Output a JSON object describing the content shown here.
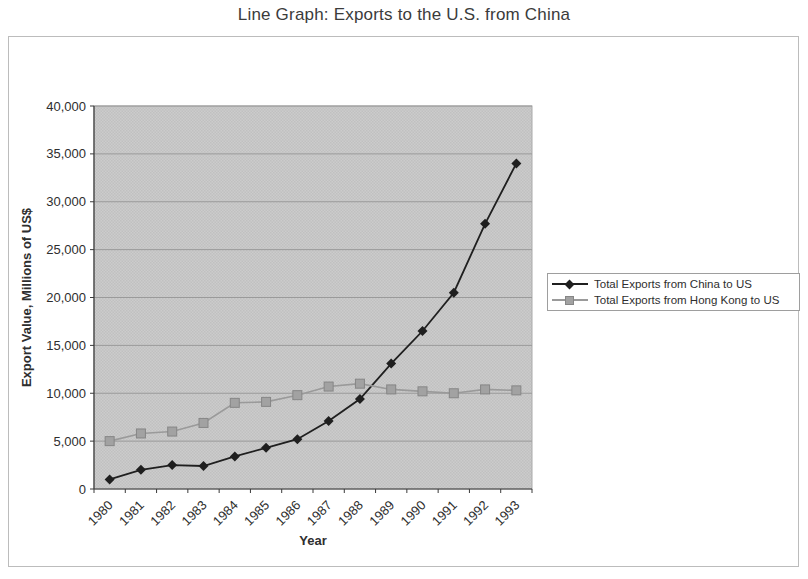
{
  "title": "Line Graph: Exports to the U.S. from China",
  "colors": {
    "china_series": "#1f1f1f",
    "hongkong_series": "#9a9a9a",
    "plot_background": "#cccccc",
    "gridline": "#9a9a9a",
    "axis": "#3a3a3a",
    "text": "#2e2e2e",
    "figure_border": "#bcbcbc",
    "legend_border": "#9e9e9e"
  },
  "chart_data": {
    "type": "line",
    "title": "Line Graph: Exports to the U.S. from China",
    "xlabel": "Year",
    "ylabel": "Export Value, Millions of US$",
    "ylim": [
      0,
      40000
    ],
    "ytick_step": 5000,
    "ytick_labels": [
      "0",
      "5,000",
      "10,000",
      "15,000",
      "20,000",
      "25,000",
      "30,000",
      "35,000",
      "40,000"
    ],
    "grid": "horizontal",
    "legend_position": "right",
    "categories": [
      "1980",
      "1981",
      "1982",
      "1983",
      "1984",
      "1985",
      "1986",
      "1987",
      "1988",
      "1989",
      "1990",
      "1991",
      "1992",
      "1993"
    ],
    "series": [
      {
        "name": "Total Exports from China to US",
        "marker": "diamond",
        "color": "#1f1f1f",
        "values": [
          1000,
          2000,
          2500,
          2400,
          3400,
          4300,
          5200,
          7100,
          9400,
          13100,
          16500,
          20500,
          27700,
          34000
        ]
      },
      {
        "name": "Total Exports from Hong Kong to US",
        "marker": "square",
        "color": "#9a9a9a",
        "values": [
          5000,
          5800,
          6000,
          6900,
          9000,
          9100,
          9800,
          10700,
          11000,
          10400,
          10200,
          10000,
          10400,
          10300
        ]
      }
    ]
  }
}
